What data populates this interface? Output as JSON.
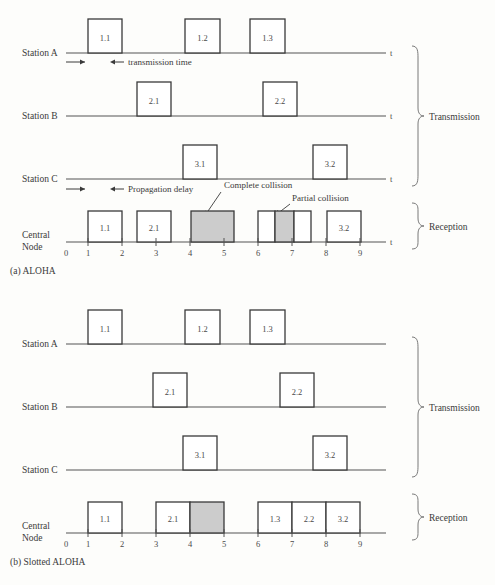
{
  "figure": {
    "panels": [
      {
        "id": "aloha",
        "caption": "(a) ALOHA",
        "group_labels": {
          "transmission": "Transmission",
          "reception": "Reception"
        },
        "annotations": {
          "transmission_time": "transmission time",
          "propagation_delay": "Propagation delay",
          "complete_collision": "Complete collision",
          "partial_collision": "Partial collision"
        },
        "axis_label": "t",
        "tick_labels": [
          "0",
          "1",
          "2",
          "3",
          "4",
          "5",
          "6",
          "7",
          "8",
          "9"
        ],
        "rows": [
          {
            "name": "Station A",
            "label": "Station A",
            "packets": [
              {
                "label": "1.1",
                "start": 1.0,
                "end": 2.0,
                "fill": "white"
              },
              {
                "label": "1.2",
                "start": 4.0,
                "end": 5.0,
                "fill": "white"
              },
              {
                "label": "1.3",
                "start": 6.0,
                "end": 7.0,
                "fill": "white"
              }
            ]
          },
          {
            "name": "Station B",
            "label": "Station B",
            "packets": [
              {
                "label": "2.1",
                "start": 2.5,
                "end": 3.5,
                "fill": "white"
              },
              {
                "label": "2.2",
                "start": 6.2,
                "end": 7.2,
                "fill": "white"
              }
            ]
          },
          {
            "name": "Station C",
            "label": "Station C",
            "packets": [
              {
                "label": "3.1",
                "start": 3.8,
                "end": 4.8,
                "fill": "white"
              },
              {
                "label": "3.2",
                "start": 7.6,
                "end": 8.6,
                "fill": "white"
              }
            ]
          },
          {
            "name": "Central Node",
            "label_line1": "Central",
            "label_line2": "Node",
            "packets": [
              {
                "label": "1.1",
                "start": 1.0,
                "end": 2.0,
                "fill": "white"
              },
              {
                "label": "2.1",
                "start": 2.5,
                "end": 3.5,
                "fill": "white"
              },
              {
                "label": "",
                "start": 4.0,
                "end": 5.0,
                "fill": "gray"
              },
              {
                "label": "",
                "start": 6.0,
                "end": 6.5,
                "fill": "white"
              },
              {
                "label": "",
                "start": 6.5,
                "end": 7.2,
                "fill": "gray"
              },
              {
                "label": "",
                "start": 7.2,
                "end": 7.7,
                "fill": "white"
              },
              {
                "label": "3.2",
                "start": 8.0,
                "end": 9.0,
                "fill": "white"
              }
            ]
          }
        ]
      },
      {
        "id": "slotted-aloha",
        "caption": "(b) Slotted ALOHA",
        "group_labels": {
          "transmission": "Transmission",
          "reception": "Reception"
        },
        "annotations": {},
        "axis_label": "t",
        "tick_labels": [
          "0",
          "1",
          "2",
          "3",
          "4",
          "5",
          "6",
          "7",
          "8",
          "9"
        ],
        "rows": [
          {
            "name": "Station A",
            "label": "Station A",
            "packets": [
              {
                "label": "1.1",
                "start": 1.0,
                "end": 2.0,
                "fill": "white"
              },
              {
                "label": "1.2",
                "start": 4.0,
                "end": 5.0,
                "fill": "white"
              },
              {
                "label": "1.3",
                "start": 6.0,
                "end": 7.0,
                "fill": "white"
              }
            ]
          },
          {
            "name": "Station B",
            "label": "Station B",
            "packets": [
              {
                "label": "2.1",
                "start": 2.5,
                "end": 3.5,
                "fill": "white"
              },
              {
                "label": "2.2",
                "start": 6.2,
                "end": 7.2,
                "fill": "white"
              }
            ]
          },
          {
            "name": "Station C",
            "label": "Station C",
            "packets": [
              {
                "label": "3.1",
                "start": 3.8,
                "end": 4.8,
                "fill": "white"
              },
              {
                "label": "3.2",
                "start": 7.6,
                "end": 8.6,
                "fill": "white"
              }
            ]
          },
          {
            "name": "Central Node",
            "label_line1": "Central",
            "label_line2": "Node",
            "packets": [
              {
                "label": "1.1",
                "start": 1.0,
                "end": 2.0,
                "fill": "white"
              },
              {
                "label": "2.1",
                "start": 3.0,
                "end": 4.0,
                "fill": "white"
              },
              {
                "label": "",
                "start": 4.0,
                "end": 5.0,
                "fill": "gray"
              },
              {
                "label": "1.3",
                "start": 6.0,
                "end": 7.0,
                "fill": "white"
              },
              {
                "label": "2.2",
                "start": 7.0,
                "end": 8.0,
                "fill": "white"
              },
              {
                "label": "3.2",
                "start": 8.0,
                "end": 9.0,
                "fill": "white"
              }
            ]
          }
        ]
      }
    ],
    "colors": {
      "collision_fill": "#cccccc",
      "packet_fill": "#ffffff",
      "stroke": "#3a3a3a",
      "axis": "#555555",
      "background": "#fdfdfb"
    }
  }
}
